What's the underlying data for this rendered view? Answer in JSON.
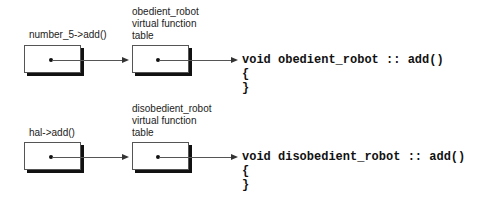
{
  "diagram": {
    "rows": [
      {
        "caller_label": "number_5->add()",
        "vtable_label": [
          "obedient_robot",
          "virtual function",
          "table"
        ],
        "code_lines": [
          "void obedient_robot :: add()",
          "{",
          "}"
        ]
      },
      {
        "caller_label": "hal->add()",
        "vtable_label": [
          "disobedient_robot",
          "virtual function",
          "table"
        ],
        "code_lines": [
          "void disobedient_robot :: add()",
          "{",
          "}"
        ]
      }
    ]
  }
}
